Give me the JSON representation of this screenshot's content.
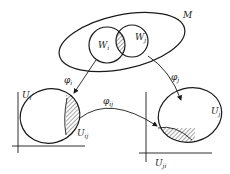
{
  "diagram": {
    "type": "manifold-charts",
    "labels": {
      "manifold": "M",
      "open_set_i": "W",
      "open_set_i_sub": "i",
      "open_set_j": "W",
      "open_set_j_sub": "j",
      "map_i": "φ",
      "map_i_sub": "i",
      "map_j": "φ",
      "map_j_sub": "j",
      "transition": "φ",
      "transition_sub": "ij",
      "chart_i": "U",
      "chart_i_sub": "i",
      "chart_j": "U",
      "chart_j_sub": "j",
      "overlap_i": "U",
      "overlap_i_sub": "ij",
      "overlap_j": "U",
      "overlap_j_sub": "ji"
    },
    "colors": {
      "ink": "#1a1a1a",
      "background": "#ffffff"
    }
  }
}
